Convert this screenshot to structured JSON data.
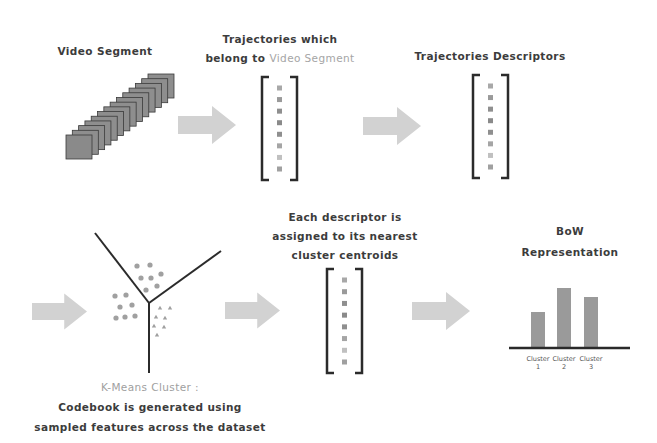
{
  "diagram": {
    "colors": {
      "arrow": "#d2d2d2",
      "bracket": "#2b2b2b",
      "dot": "#a8a8a8",
      "frame": "#8e8e8e",
      "frame_border": "#3a3a3a",
      "bar": "#9a9a9a",
      "highlight_text": "#a5a5a5"
    },
    "row1": {
      "video_segment": {
        "title": "Video Segment",
        "frame_count": 14,
        "frame-icon": "video-frame-stack-icon"
      },
      "trajectories": {
        "title_line1": "Trajectories which",
        "title_line2_prefix": "belong to ",
        "title_line2_highlight": "Video Segment",
        "vector_entries": 8
      },
      "descriptors": {
        "title": "Trajectories Descriptors",
        "vector_entries": 8
      }
    },
    "row2": {
      "kmeans": {
        "caption_highlight": "K-Means Cluster :",
        "caption_line1": "Codebook is generated using",
        "caption_line2": "sampled features across the dataset"
      },
      "assignment": {
        "title_line1": "Each descriptor is",
        "title_line2": "assigned to its nearest",
        "title_line3": "cluster centroids",
        "vector_entries": 8
      },
      "bow": {
        "title_line1": "BoW",
        "title_line2": "Representation"
      }
    },
    "arrows": [
      "video-to-trajectories",
      "trajectories-to-descriptors",
      "descriptors-to-kmeans",
      "kmeans-to-assignment",
      "assignment-to-bow"
    ]
  },
  "chart_data": {
    "type": "bar",
    "categories": [
      "Cluster 1",
      "Cluster 2",
      "Cluster 3"
    ],
    "category_lines": [
      [
        "Cluster",
        "1"
      ],
      [
        "Cluster",
        "2"
      ],
      [
        "Cluster",
        "3"
      ]
    ],
    "values": [
      35,
      59,
      50
    ],
    "xlabel": "",
    "ylabel": "",
    "grid": false,
    "legend": null
  }
}
